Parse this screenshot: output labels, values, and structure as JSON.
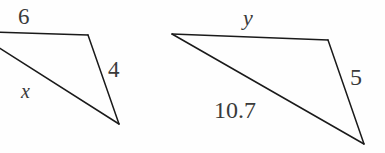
{
  "figure": {
    "background_color": "#fefefe",
    "stroke_color": "#1a1a1a",
    "text_color": "#3a3a3a",
    "triangles": [
      {
        "name": "left-triangle",
        "labels": {
          "top_side": "6",
          "diagonal_side": "x",
          "right_side": "4"
        },
        "vertices": {
          "top_left": [
            -8,
            32
          ],
          "top_right": [
            88,
            35
          ],
          "bottom_right": [
            119,
            124
          ]
        }
      },
      {
        "name": "right-triangle",
        "labels": {
          "top_side": "y",
          "diagonal_side": "10.7",
          "right_side": "5"
        },
        "vertices": {
          "top_left": [
            172,
            34
          ],
          "top_right": [
            328,
            40
          ],
          "bottom_right": [
            364,
            144
          ]
        }
      }
    ]
  }
}
